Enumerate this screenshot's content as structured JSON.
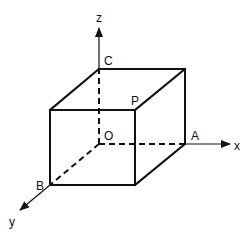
{
  "diagram": {
    "type": "3d-rectangular-box-with-axes",
    "colors": {
      "line": "#111111",
      "background": "#ffffff"
    },
    "axes": [
      {
        "name": "x",
        "label": "x"
      },
      {
        "name": "y",
        "label": "y"
      },
      {
        "name": "z",
        "label": "z"
      }
    ],
    "points": {
      "O": "O",
      "A": "A",
      "B": "B",
      "C": "C",
      "P": "P"
    },
    "edge_styles": {
      "visible": "solid",
      "hidden": "dashed"
    }
  }
}
